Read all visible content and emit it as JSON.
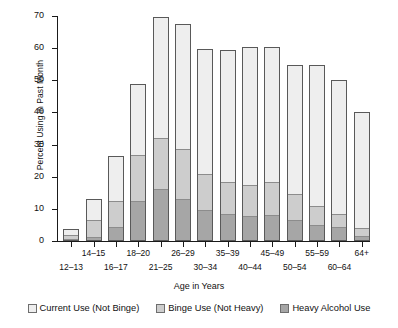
{
  "chart_data": {
    "type": "bar",
    "subtype": "stacked-vertical",
    "title": "",
    "xlabel": "Age in Years",
    "ylabel": "Percent Using in Past Month",
    "ylim": [
      0,
      70
    ],
    "ytick_values": [
      0,
      10,
      20,
      30,
      40,
      50,
      60,
      70
    ],
    "ytick_labels": [
      "0",
      "10",
      "20",
      "30",
      "40",
      "50",
      "60",
      "70"
    ],
    "grid": false,
    "legend_position": "bottom",
    "categories": [
      "12–13",
      "14–15",
      "16–17",
      "18–20",
      "21–25",
      "26–29",
      "30–34",
      "35–39",
      "40–44",
      "45–49",
      "50–54",
      "55–59",
      "60–64",
      "64+"
    ],
    "series": [
      {
        "name": "Heavy Alcohol Use",
        "color": "#a6a6a6",
        "values": [
          0.3,
          0.9,
          4.2,
          12.2,
          15.9,
          12.9,
          9.3,
          8.1,
          7.6,
          8.0,
          6.2,
          4.6,
          4.0,
          1.4
        ]
      },
      {
        "name": "Binge Use (Not Heavy)",
        "color": "#cdcdcd",
        "values": [
          1.5,
          5.6,
          8.1,
          14.6,
          16.2,
          15.6,
          11.5,
          10.1,
          9.8,
          10.3,
          8.4,
          6.1,
          4.1,
          2.3
        ]
      },
      {
        "name": "Current Use (Not Binge)",
        "color": "#eeeeee",
        "values": [
          1.9,
          6.5,
          14.0,
          22.1,
          37.6,
          38.9,
          38.9,
          41.3,
          42.9,
          42.2,
          40.2,
          44.0,
          42.1,
          36.3
        ]
      }
    ],
    "totals": [
      3.7,
      13.0,
      26.3,
      48.9,
      69.7,
      67.4,
      59.7,
      59.5,
      60.3,
      60.5,
      54.8,
      54.7,
      50.2,
      40.0
    ]
  },
  "axes": {
    "y_title": "Percent Using in Past Month",
    "x_title": "Age in Years"
  },
  "legend": {
    "items": [
      {
        "label": "Current Use (Not Binge)",
        "color": "#eeeeee"
      },
      {
        "label": "Binge Use (Not Heavy)",
        "color": "#cdcdcd"
      },
      {
        "label": "Heavy Alcohol Use",
        "color": "#a6a6a6"
      }
    ]
  }
}
